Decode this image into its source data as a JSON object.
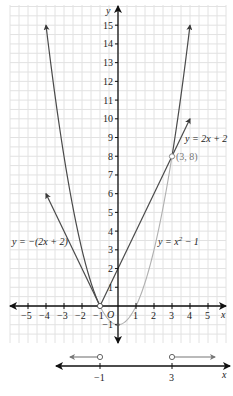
{
  "chart_data": {
    "type": "line",
    "title": "",
    "xlabel": "x",
    "ylabel": "y",
    "origin_label": "O",
    "xlim": [
      -5.5,
      5.5
    ],
    "ylim": [
      -2,
      15.5
    ],
    "x_ticks": [
      -5,
      -4,
      -3,
      -2,
      -1,
      1,
      2,
      3,
      4,
      5
    ],
    "y_ticks": [
      -1,
      1,
      2,
      3,
      4,
      5,
      6,
      7,
      8,
      9,
      10,
      11,
      12,
      13,
      14,
      15
    ],
    "grid": true,
    "series": [
      {
        "name": "y = -(2x + 2)",
        "type": "line",
        "points": [
          [
            -1,
            0
          ],
          [
            -4,
            6
          ]
        ],
        "color": "#4a4a4a"
      },
      {
        "name": "y = 2x + 2",
        "type": "line",
        "points": [
          [
            -1,
            0
          ],
          [
            4,
            10
          ]
        ],
        "color": "#4a4a4a"
      },
      {
        "name": "y = x^2 - 1",
        "type": "curve",
        "domain": [
          -4,
          4
        ],
        "dark_segments": [
          [
            -4,
            -1
          ],
          [
            3,
            4
          ]
        ],
        "light_segment": [
          -1,
          3
        ],
        "color_dark": "#4a4a4a",
        "color_light": "#aaaaaa"
      }
    ],
    "annotations": [
      {
        "text": "(3, 8)",
        "x": 3,
        "y": 8
      },
      {
        "text": "y = 2x + 2"
      },
      {
        "text": "y = -(2x + 2)"
      },
      {
        "text": "y = x² - 1"
      }
    ],
    "intersection_points": [
      [
        -1,
        0
      ],
      [
        3,
        8
      ]
    ],
    "number_line": {
      "label": "x",
      "ticks": [
        -1,
        3
      ],
      "solution": "x < -1 or x > 3",
      "open_circles": [
        -1,
        3
      ]
    }
  },
  "labels": {
    "y_axis": "y",
    "x_axis": "x",
    "origin": "O",
    "point_label": "(3, 8)",
    "eq_line_pos": "y = 2x + 2",
    "eq_line_neg": "y = −(2x + 2)",
    "eq_parabola_pre": "y = x",
    "eq_parabola_exp": "2",
    "eq_parabola_post": " − 1",
    "nl_tick_a": "−1",
    "nl_tick_b": "3",
    "nl_axis": "x"
  },
  "ticks": {
    "x": [
      "−5",
      "−4",
      "−3",
      "−2",
      "−1",
      "1",
      "2",
      "3",
      "4",
      "5"
    ],
    "y": [
      "15",
      "14",
      "13",
      "12",
      "11",
      "10",
      "9",
      "8",
      "7",
      "6",
      "5",
      "4",
      "3",
      "2",
      "1",
      "−1"
    ]
  }
}
